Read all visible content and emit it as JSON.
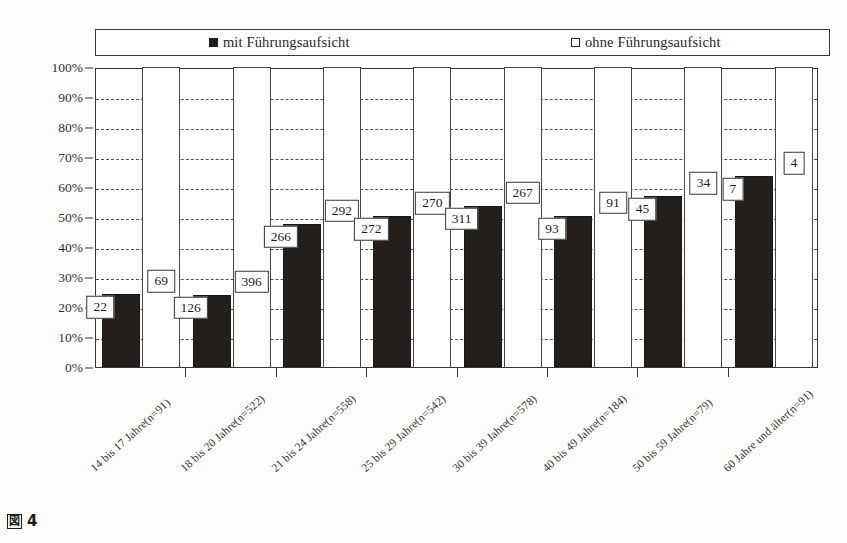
{
  "figure": {
    "caption_marker": "図",
    "caption_number": "4"
  },
  "legend": {
    "position": "top",
    "entries": [
      {
        "label": "mit Führungsaufsicht",
        "swatch": "filled-square-icon",
        "color": "#231f1c"
      },
      {
        "label": "ohne Führungsaufsicht",
        "swatch": "empty-square-icon",
        "color": "#ffffff"
      }
    ]
  },
  "axes": {
    "y_ticks": [
      "100%",
      "90%",
      "80%",
      "70%",
      "60%",
      "50%",
      "40%",
      "30%",
      "20%",
      "10%",
      "0%"
    ],
    "y_min": 0,
    "y_max": 100
  },
  "chart_data": {
    "type": "bar",
    "title": "",
    "subtitle": "",
    "xlabel": "",
    "ylabel": "",
    "ylim": [
      0,
      100
    ],
    "grid": true,
    "legend_position": "top",
    "stacked_to_100": true,
    "categories": [
      "14 bis 17 Jahre(n=91)",
      "18 bis 20 Jahre(n=522)",
      "21 bis 24 Jahre(n=558)",
      "25 bis 29 Jahre(n=542)",
      "30 bis 39 Jahre(n=578)",
      "40 bis 49 Jahre(n=184)",
      "50 bis 59 Jahre(n=79)",
      "60 Jahre und älter(n=91)"
    ],
    "series": [
      {
        "name": "mit Führungsaufsicht",
        "color": "#231f1c",
        "counts": [
          22,
          126,
          266,
          272,
          311,
          93,
          45,
          7
        ],
        "values": [
          24.2,
          24.1,
          47.7,
          50.2,
          53.8,
          50.5,
          57.0,
          63.6
        ]
      },
      {
        "name": "ohne Führungsaufsicht",
        "color": "#ffffff",
        "counts": [
          69,
          396,
          292,
          270,
          267,
          91,
          34,
          4
        ],
        "values": [
          75.8,
          75.9,
          52.3,
          49.8,
          46.2,
          49.5,
          43.0,
          36.4
        ]
      }
    ],
    "annotations": [
      {
        "category_index": 0,
        "series": "mit",
        "text": "22"
      },
      {
        "category_index": 0,
        "series": "ohne",
        "text": "69"
      },
      {
        "category_index": 1,
        "series": "mit",
        "text": "126"
      },
      {
        "category_index": 1,
        "series": "ohne",
        "text": "396"
      },
      {
        "category_index": 2,
        "series": "mit",
        "text": "266"
      },
      {
        "category_index": 2,
        "series": "ohne",
        "text": "292"
      },
      {
        "category_index": 3,
        "series": "mit",
        "text": "272"
      },
      {
        "category_index": 3,
        "series": "ohne",
        "text": "270"
      },
      {
        "category_index": 4,
        "series": "mit",
        "text": "311"
      },
      {
        "category_index": 4,
        "series": "ohne",
        "text": "267"
      },
      {
        "category_index": 5,
        "series": "mit",
        "text": "93"
      },
      {
        "category_index": 5,
        "series": "ohne",
        "text": "91"
      },
      {
        "category_index": 6,
        "series": "mit",
        "text": "45"
      },
      {
        "category_index": 6,
        "series": "ohne",
        "text": "34"
      },
      {
        "category_index": 7,
        "series": "mit",
        "text": "7"
      },
      {
        "category_index": 7,
        "series": "ohne",
        "text": "4"
      }
    ]
  }
}
